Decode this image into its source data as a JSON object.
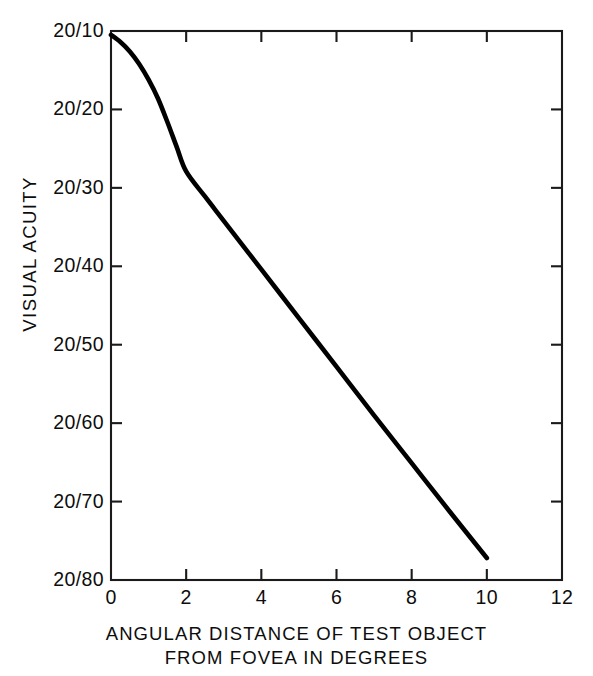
{
  "chart_data": {
    "type": "line",
    "title": "",
    "subtitle": "",
    "xlabel_line1": "ANGULAR DISTANCE OF TEST OBJECT",
    "xlabel_line2": "FROM FOVEA IN DEGREES",
    "ylabel": "VISUAL ACUITY",
    "xlim": [
      0,
      12
    ],
    "ylim_snellen_denominator": [
      10,
      80
    ],
    "grid": false,
    "legend": null,
    "x_ticks": [
      0,
      2,
      4,
      6,
      8,
      10,
      12
    ],
    "x_tick_labels": [
      "0",
      "2",
      "4",
      "6",
      "8",
      "10",
      "12"
    ],
    "y_ticks": [
      10,
      20,
      30,
      40,
      50,
      60,
      70,
      80
    ],
    "y_tick_labels": [
      "20/10",
      "20/20",
      "20/30",
      "20/40",
      "20/50",
      "20/60",
      "20/70",
      "20/80"
    ],
    "y_axis_direction": "inverted",
    "series": [
      {
        "name": "visual acuity vs eccentricity",
        "color": "#000000",
        "x": [
          0.0,
          0.25,
          0.5,
          0.75,
          1.0,
          1.25,
          1.5,
          1.75,
          2.0,
          2.5,
          3.0,
          4.0,
          5.0,
          6.0,
          7.0,
          8.0,
          9.0,
          10.0
        ],
        "y_snellen_denominator": [
          10.5,
          11.4,
          12.6,
          14.2,
          16.2,
          18.6,
          21.6,
          24.8,
          27.9,
          31.1,
          34.2,
          40.4,
          46.6,
          52.8,
          59.0,
          65.1,
          71.2,
          77.2
        ]
      }
    ],
    "axis_frame": "full-box",
    "tick_direction": "inward",
    "background_color": "#ffffff",
    "line_color": "#000000",
    "axis_color": "#1a1a1a"
  }
}
